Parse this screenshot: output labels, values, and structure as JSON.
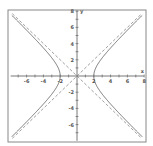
{
  "chart_data": {
    "type": "line",
    "title": "",
    "xlabel": "x",
    "ylabel": "y",
    "xlim": [
      -8,
      8
    ],
    "ylim": [
      -8,
      8
    ],
    "grid": false,
    "x_ticks": [
      -6,
      -4,
      -2,
      2,
      4,
      6,
      8
    ],
    "y_ticks": [
      8,
      6,
      4,
      2,
      -2,
      -4,
      -6
    ],
    "x_tick_labels": [
      "-6",
      "-4",
      "-2",
      "2",
      "4",
      "6",
      "8"
    ],
    "y_tick_labels": [
      "8",
      "6",
      "4",
      "2",
      "-2",
      "-4",
      "-6"
    ],
    "series": [
      {
        "name": "hyperbola",
        "style": "solid",
        "equation": "x^2/4 - y^2/4 = 1",
        "a": 2,
        "b": 2
      },
      {
        "name": "asymptote y=x",
        "style": "dashed",
        "equation": "y = x"
      },
      {
        "name": "asymptote y=-x",
        "style": "dashed",
        "equation": "y = -x"
      }
    ],
    "colors": {
      "curve": "#777777",
      "axis": "#555555",
      "frame": "#888888"
    }
  }
}
